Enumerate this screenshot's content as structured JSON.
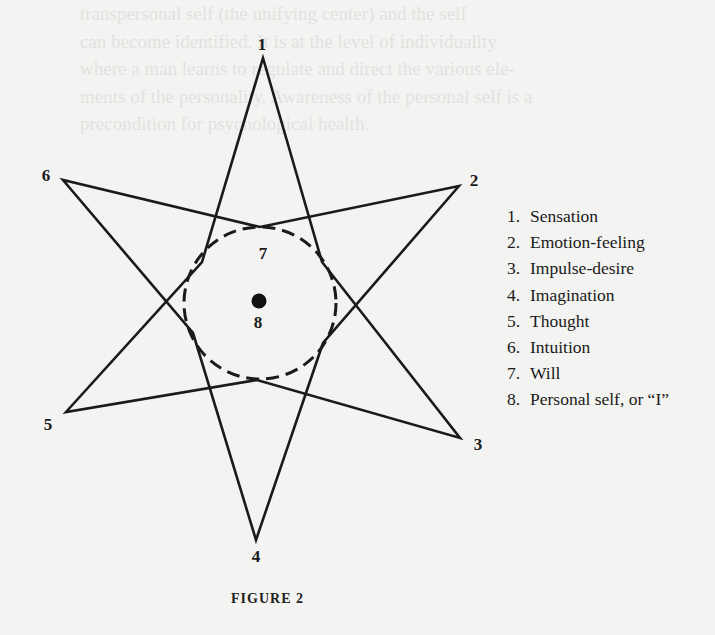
{
  "figure": {
    "caption": "FIGURE 2",
    "type": "egg-star diagram (psychosynthesis star)",
    "colors": {
      "ink": "#1a1a1a",
      "paper": "#f3f3f1"
    },
    "outer_vertices": [
      {
        "id": "1",
        "label": "1",
        "x": 263,
        "y": 58,
        "label_x": 262,
        "label_y": 50
      },
      {
        "id": "2",
        "label": "2",
        "x": 459,
        "y": 186,
        "label_x": 474,
        "label_y": 186
      },
      {
        "id": "3",
        "label": "3",
        "x": 460,
        "y": 438,
        "label_x": 477,
        "label_y": 450
      },
      {
        "id": "4",
        "label": "4",
        "x": 256,
        "y": 540,
        "label_x": 256,
        "label_y": 562
      },
      {
        "id": "5",
        "label": "5",
        "x": 66,
        "y": 412,
        "label_x": 48,
        "label_y": 430
      },
      {
        "id": "6",
        "label": "6",
        "x": 63,
        "y": 180,
        "label_x": 46,
        "label_y": 181
      }
    ],
    "inner_center": {
      "will_label": "7",
      "self_label": "8"
    },
    "circle": {
      "cx": 260,
      "cy": 303,
      "r": 76,
      "style": "dashed"
    }
  },
  "legend": {
    "items": [
      {
        "num": "1.",
        "label": "Sensation"
      },
      {
        "num": "2.",
        "label": "Emotion-feeling"
      },
      {
        "num": "3.",
        "label": "Impulse-desire"
      },
      {
        "num": "4.",
        "label": "Imagination"
      },
      {
        "num": "5.",
        "label": "Thought"
      },
      {
        "num": "6.",
        "label": "Intuition"
      },
      {
        "num": "7.",
        "label": "Will"
      },
      {
        "num": "8.",
        "label": "Personal self, or “I”"
      }
    ]
  },
  "background_showthrough": [
    "transpersonal self (the unifying center) and the self",
    "can become identified. It is at the level of individuality",
    "where a man learns to regulate and direct the various ele-",
    "ments of the personality. Awareness of the personal self is a",
    "precondition for psychological health.",
    "",
    "",
    "",
    "",
    "",
    "",
    "",
    "",
    "",
    "",
    "",
    "",
    "",
    "",
    "",
    "",
    "Personal and transpersonal Self, we have at least two levels"
  ]
}
